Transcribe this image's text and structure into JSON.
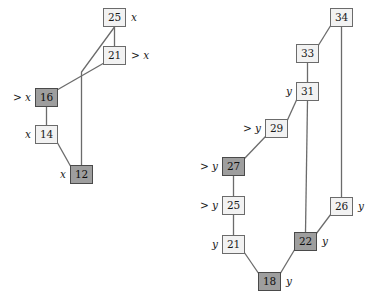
{
  "figure": {
    "title": "",
    "type": "two-heap-tree-diagram",
    "width": 370,
    "height": 298,
    "colors": {
      "node_fill_light": "#f2f2f2",
      "node_fill_dark": "#9e9e9e",
      "node_border": "#6b6b6b",
      "node_border_dark": "#4a4a4a",
      "edge": "#6b6b6b",
      "text": "#1a1a1a",
      "background": "#ffffff"
    }
  },
  "trees": [
    {
      "id": "left-tree",
      "name": "x-tree",
      "nodes": [
        {
          "id": "L25",
          "value": "25",
          "x": 103,
          "y": 8,
          "fill": "light",
          "label": "x",
          "label_side": "right"
        },
        {
          "id": "L21",
          "value": "21",
          "x": 103,
          "y": 46,
          "fill": "light",
          "label": "> x",
          "label_side": "right"
        },
        {
          "id": "L16",
          "value": "16",
          "x": 35,
          "y": 88,
          "fill": "dark",
          "label": "> x",
          "label_side": "left"
        },
        {
          "id": "L14",
          "value": "14",
          "x": 35,
          "y": 125,
          "fill": "light",
          "label": "x",
          "label_side": "left"
        },
        {
          "id": "L12",
          "value": "12",
          "x": 70,
          "y": 165,
          "fill": "dark",
          "label": "x",
          "label_side": "left"
        }
      ],
      "edges": [
        {
          "from": "L25",
          "to": "L21",
          "kind": "vertical"
        },
        {
          "from": "L25",
          "to": "L12",
          "kind": "elbow"
        },
        {
          "from": "L21",
          "to": "L16",
          "kind": "diagonal"
        },
        {
          "from": "L16",
          "to": "L14",
          "kind": "vertical"
        },
        {
          "from": "L14",
          "to": "L12",
          "kind": "diagonal"
        }
      ]
    },
    {
      "id": "right-tree",
      "name": "y-tree",
      "nodes": [
        {
          "id": "R34",
          "value": "34",
          "x": 330,
          "y": 8,
          "fill": "light",
          "label": "",
          "label_side": "right"
        },
        {
          "id": "R33",
          "value": "33",
          "x": 296,
          "y": 44,
          "fill": "light",
          "label": "",
          "label_side": "right"
        },
        {
          "id": "R31",
          "value": "31",
          "x": 296,
          "y": 82,
          "fill": "light",
          "label": "y",
          "label_side": "left"
        },
        {
          "id": "R29",
          "value": "29",
          "x": 265,
          "y": 119,
          "fill": "light",
          "label": "> y",
          "label_side": "left"
        },
        {
          "id": "R27",
          "value": "27",
          "x": 222,
          "y": 157,
          "fill": "dark",
          "label": "> y",
          "label_side": "left"
        },
        {
          "id": "R25",
          "value": "25",
          "x": 222,
          "y": 196,
          "fill": "light",
          "label": "> y",
          "label_side": "left"
        },
        {
          "id": "R26",
          "value": "26",
          "x": 330,
          "y": 197,
          "fill": "light",
          "label": "y",
          "label_side": "right"
        },
        {
          "id": "R21",
          "value": "21",
          "x": 222,
          "y": 235,
          "fill": "light",
          "label": "y",
          "label_side": "left"
        },
        {
          "id": "R22",
          "value": "22",
          "x": 294,
          "y": 232,
          "fill": "dark",
          "label": "y",
          "label_side": "right"
        },
        {
          "id": "R18",
          "value": "18",
          "x": 258,
          "y": 272,
          "fill": "dark",
          "label": "y",
          "label_side": "right"
        }
      ],
      "edges": [
        {
          "from": "R34",
          "to": "R33",
          "kind": "diagonal"
        },
        {
          "from": "R34",
          "to": "R26",
          "kind": "vertical"
        },
        {
          "from": "R33",
          "to": "R31",
          "kind": "vertical"
        },
        {
          "from": "R31",
          "to": "R29",
          "kind": "diagonal"
        },
        {
          "from": "R31",
          "to": "R22",
          "kind": "vertical"
        },
        {
          "from": "R29",
          "to": "R27",
          "kind": "diagonal"
        },
        {
          "from": "R27",
          "to": "R25",
          "kind": "vertical"
        },
        {
          "from": "R25",
          "to": "R21",
          "kind": "vertical"
        },
        {
          "from": "R21",
          "to": "R18",
          "kind": "diagonal"
        },
        {
          "from": "R26",
          "to": "R22",
          "kind": "diagonal"
        },
        {
          "from": "R22",
          "to": "R18",
          "kind": "diagonal"
        }
      ]
    }
  ]
}
